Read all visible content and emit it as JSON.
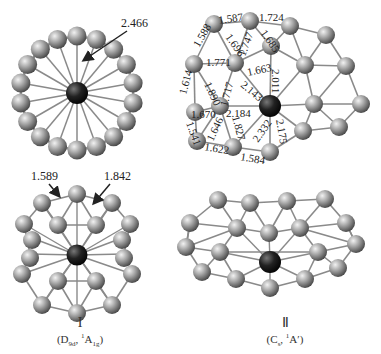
{
  "figure": {
    "structures": [
      {
        "id": "I",
        "roman_label": "I",
        "symmetry_label": "(D₉d, ¹A₁g)",
        "symmetry_parts": {
          "point_group": "D",
          "pg_sub": "9d",
          "state_sup": "1",
          "state": "A",
          "state_sub": "1g"
        },
        "views": [
          "top",
          "side"
        ],
        "top_view_annotations": [
          {
            "value": "2.466",
            "points_to": "center-to-ring bond"
          }
        ],
        "side_view_annotations": [
          {
            "value": "1.589",
            "points_to": "ring bond"
          },
          {
            "value": "1.842",
            "points_to": "inter-ring bond"
          }
        ]
      },
      {
        "id": "II",
        "roman_label": "Ⅱ",
        "symmetry_label": "(Cₛ, ¹A′)",
        "symmetry_parts": {
          "point_group": "C",
          "pg_sub": "s",
          "state_sup": "1",
          "state": "A",
          "state_sub": "′"
        },
        "views": [
          "top",
          "side"
        ],
        "bond_lengths": [
          "1.587",
          "1.724",
          "1.588",
          "1.696",
          "1.747",
          "1.685",
          "1.771",
          "1.614",
          "1.890",
          "1.717",
          "1.663",
          "2.011",
          "2.143",
          "1.670",
          "2.184",
          "1.646",
          "1.827",
          "2.332",
          "2.175",
          "1.541",
          "1.622",
          "1.584"
        ]
      }
    ],
    "colors": {
      "ring_atom": "#9a9a9a",
      "center_atom": "#222222",
      "bond": "#8a8a8a",
      "text": "#222222"
    }
  },
  "labels": {
    "I_top_2466": "2.466",
    "I_side_1589": "1.589",
    "I_side_1842": "1.842",
    "II": {
      "b1587": "1.587",
      "b1724": "1.724",
      "b1588": "1.588",
      "b1696": "1.696",
      "b1747": "1.747",
      "b1685": "1.685",
      "b1771": "1.771",
      "b1614": "1.614",
      "b1890": "1.890",
      "b1717": "1.717",
      "b1663": "1.663",
      "b2011": "2.011",
      "b2143": "2.143",
      "b1670": "1.670",
      "b2184": "2.184",
      "b1646": "1.646",
      "b1827": "1.827",
      "b2332": "2.332",
      "b2175": "2.175",
      "b1541": "1.541",
      "b1622": "1.622",
      "b1584": "1.584"
    },
    "cap_I_roman": "I",
    "cap_I_pg": "D",
    "cap_I_pg_sub": "9d",
    "cap_I_sup": "1",
    "cap_I_state": "A",
    "cap_I_state_sub": "1g",
    "cap_II_roman": "Ⅱ",
    "cap_II_pg": "C",
    "cap_II_pg_sub": "s",
    "cap_II_sup": "1",
    "cap_II_state": "A′"
  }
}
